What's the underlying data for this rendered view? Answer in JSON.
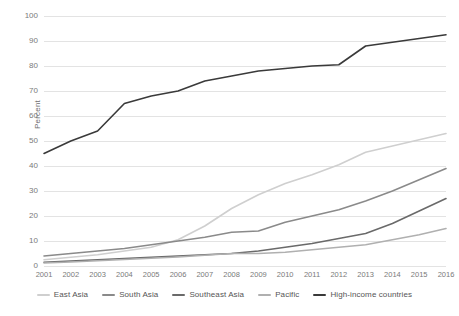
{
  "chart_data": {
    "type": "line",
    "title": "",
    "xlabel": "",
    "ylabel": "Percent",
    "ylim": [
      0,
      100
    ],
    "ytick_step": 10,
    "grid": true,
    "legend_position": "bottom",
    "x": [
      "2001",
      "2002",
      "2003",
      "2004",
      "2005",
      "2006",
      "2007",
      "2008",
      "2009",
      "2010",
      "2011",
      "2012",
      "2013",
      "2014",
      "2015",
      "2016"
    ],
    "yticks": [
      "0",
      "10",
      "20",
      "30",
      "40",
      "50",
      "60",
      "70",
      "80",
      "90",
      "100"
    ],
    "series": [
      {
        "name": "East Asia",
        "color": "#cfcfcf",
        "values": [
          2.5,
          3.5,
          4.5,
          6,
          7.5,
          10.5,
          16,
          23,
          28.5,
          33,
          36.5,
          40.5,
          45.5,
          48,
          50.5,
          53
        ]
      },
      {
        "name": "South Asia",
        "color": "#8a8a8a",
        "values": [
          4,
          5,
          6,
          7,
          8.5,
          10,
          11.5,
          13.5,
          14,
          17.5,
          20,
          22.5,
          26,
          30,
          34.5,
          39
        ]
      },
      {
        "name": "Southeast Asia",
        "color": "#6a6a6a",
        "values": [
          1.5,
          2,
          2.5,
          3,
          3.5,
          4,
          4.5,
          5,
          6,
          7.5,
          9,
          11,
          13,
          17,
          22,
          27
        ]
      },
      {
        "name": "Pacific",
        "color": "#b0b0b0",
        "values": [
          1.2,
          1.6,
          2.1,
          2.6,
          3.1,
          3.6,
          4.3,
          5,
          5,
          5.5,
          6.5,
          7.5,
          8.5,
          10.5,
          12.5,
          15
        ]
      },
      {
        "name": "High-income countries",
        "color": "#3a3a3a",
        "values": [
          45,
          50,
          54,
          65,
          68,
          70,
          74,
          76,
          78,
          79,
          80,
          80.5,
          88,
          89.5,
          91,
          92.5
        ]
      }
    ]
  }
}
